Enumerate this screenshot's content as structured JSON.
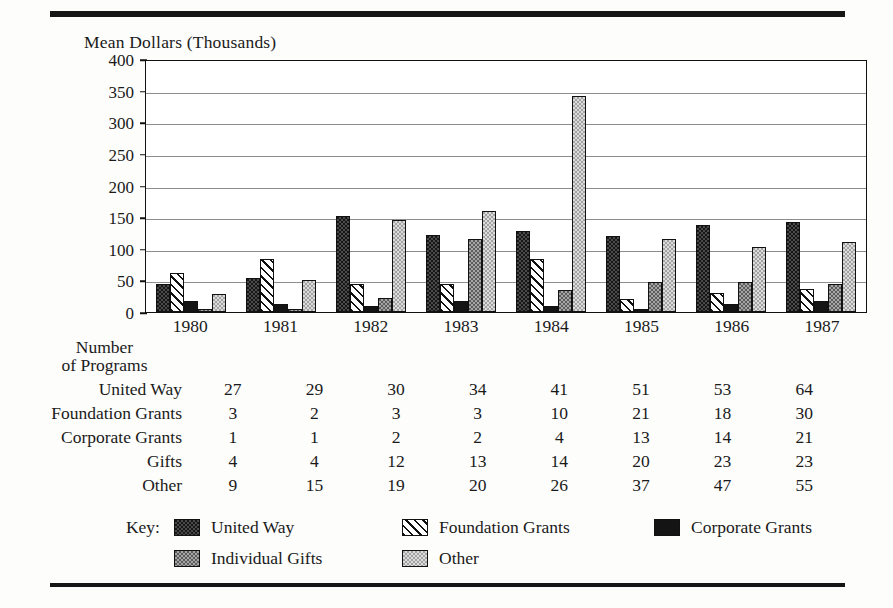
{
  "axis_title": "Mean Dollars (Thousands)",
  "table_header": {
    "line1": "Number",
    "line2": "of Programs"
  },
  "key_label": "Key:",
  "series_colors": {
    "united_way": "#4a4a4a",
    "foundation_grants": "#ffffff",
    "corporate_grants": "#141414",
    "individual_gifts": "#a5a5a5",
    "other": "#dcdcdc"
  },
  "legend": [
    {
      "label": "United Way",
      "pattern": "dark-dotted",
      "swatch": "united-way-swatch"
    },
    {
      "label": "Foundation Grants",
      "pattern": "diagonal-hatch",
      "swatch": "foundation-grants-swatch"
    },
    {
      "label": "Corporate Grants",
      "pattern": "solid-black",
      "swatch": "corporate-grants-swatch"
    },
    {
      "label": "Individual Gifts",
      "pattern": "gray-dotted",
      "swatch": "individual-gifts-swatch"
    },
    {
      "label": "Other",
      "pattern": "light-dotted",
      "swatch": "other-swatch"
    }
  ],
  "table": {
    "row_labels": [
      "United Way",
      "Foundation Grants",
      "Corporate Grants",
      "Gifts",
      "Other"
    ],
    "rows": [
      {
        "label": "United Way",
        "values": [
          27,
          29,
          30,
          34,
          41,
          51,
          53,
          64
        ]
      },
      {
        "label": "Foundation Grants",
        "values": [
          3,
          2,
          3,
          3,
          10,
          21,
          18,
          30
        ]
      },
      {
        "label": "Corporate Grants",
        "values": [
          1,
          1,
          2,
          2,
          4,
          13,
          14,
          21
        ]
      },
      {
        "label": "Gifts",
        "values": [
          4,
          4,
          12,
          13,
          14,
          20,
          23,
          23
        ]
      },
      {
        "label": "Other",
        "values": [
          9,
          15,
          19,
          20,
          26,
          37,
          47,
          55
        ]
      }
    ]
  },
  "chart_data": {
    "type": "bar",
    "title": "",
    "xlabel": "",
    "ylabel": "Mean Dollars (Thousands)",
    "ylim": [
      0,
      400
    ],
    "yticks": [
      0,
      50,
      100,
      150,
      200,
      250,
      300,
      350,
      400
    ],
    "grid": true,
    "legend_position": "bottom",
    "categories": [
      "1980",
      "1981",
      "1982",
      "1983",
      "1984",
      "1985",
      "1986",
      "1987"
    ],
    "series": [
      {
        "name": "United Way",
        "values": [
          45,
          53,
          152,
          122,
          128,
          120,
          137,
          142
        ]
      },
      {
        "name": "Foundation Grants",
        "values": [
          62,
          84,
          45,
          45,
          84,
          20,
          30,
          37
        ]
      },
      {
        "name": "Corporate Grants",
        "values": [
          18,
          12,
          10,
          18,
          10,
          5,
          13,
          18
        ]
      },
      {
        "name": "Individual Gifts",
        "values": [
          5,
          5,
          22,
          115,
          35,
          47,
          48,
          45
        ]
      },
      {
        "name": "Other",
        "values": [
          28,
          50,
          146,
          160,
          342,
          115,
          103,
          110
        ]
      }
    ]
  }
}
